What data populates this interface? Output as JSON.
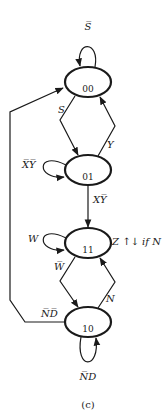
{
  "diagram": {
    "type": "state-diagram",
    "caption": "(c)",
    "states": [
      {
        "id": "00",
        "label": "00"
      },
      {
        "id": "01",
        "label": "01"
      },
      {
        "id": "11",
        "label": "11",
        "output": "Z ↑↓ if N"
      },
      {
        "id": "10",
        "label": "10"
      }
    ],
    "transitions": [
      {
        "from": "00",
        "to": "00",
        "label": "S̅"
      },
      {
        "from": "00",
        "to": "01",
        "label": "S"
      },
      {
        "from": "01",
        "to": "00",
        "label": "Y"
      },
      {
        "from": "01",
        "to": "01",
        "label": "X̅Y̅"
      },
      {
        "from": "01",
        "to": "11",
        "label": "XY̅"
      },
      {
        "from": "11",
        "to": "11",
        "label": "W"
      },
      {
        "from": "11",
        "to": "10",
        "label": "W̅"
      },
      {
        "from": "10",
        "to": "11",
        "label": "N"
      },
      {
        "from": "10",
        "to": "00",
        "label": "N̅D̅"
      },
      {
        "from": "10",
        "to": "10",
        "label": "N̅D"
      }
    ],
    "colors": {
      "stroke": "#1a1a1a",
      "background": "#ffffff"
    }
  }
}
